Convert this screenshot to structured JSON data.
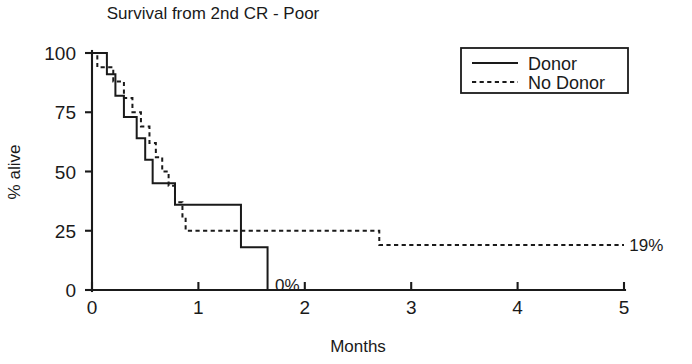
{
  "chart_data": {
    "type": "line",
    "title": "Survival from 2nd CR - Poor",
    "xlabel": "Months",
    "ylabel": "% alive",
    "xlim": [
      0,
      5
    ],
    "ylim": [
      0,
      100
    ],
    "xticks": [
      "0",
      "1",
      "2",
      "3",
      "4",
      "5"
    ],
    "xtick_values": [
      0,
      1,
      2,
      3,
      4,
      5
    ],
    "yticks": [
      "0",
      "25",
      "50",
      "75",
      "100"
    ],
    "ytick_values": [
      0,
      25,
      50,
      75,
      100
    ],
    "grid": false,
    "legend_position": "top-right",
    "series": [
      {
        "name": "Donor",
        "style": "solid",
        "points": [
          [
            0.0,
            100
          ],
          [
            0.14,
            100
          ],
          [
            0.14,
            91
          ],
          [
            0.22,
            91
          ],
          [
            0.22,
            82
          ],
          [
            0.3,
            82
          ],
          [
            0.3,
            73
          ],
          [
            0.42,
            73
          ],
          [
            0.42,
            64
          ],
          [
            0.5,
            64
          ],
          [
            0.5,
            55
          ],
          [
            0.57,
            55
          ],
          [
            0.57,
            45
          ],
          [
            0.78,
            45
          ],
          [
            0.78,
            36
          ],
          [
            1.4,
            36
          ],
          [
            1.4,
            18
          ],
          [
            1.65,
            18
          ],
          [
            1.65,
            0
          ],
          [
            1.8,
            0
          ]
        ]
      },
      {
        "name": "No Donor",
        "style": "dotted",
        "points": [
          [
            0.0,
            100
          ],
          [
            0.05,
            100
          ],
          [
            0.05,
            94
          ],
          [
            0.2,
            94
          ],
          [
            0.2,
            88
          ],
          [
            0.3,
            88
          ],
          [
            0.3,
            81
          ],
          [
            0.38,
            81
          ],
          [
            0.38,
            75
          ],
          [
            0.46,
            75
          ],
          [
            0.46,
            69
          ],
          [
            0.54,
            69
          ],
          [
            0.54,
            62
          ],
          [
            0.6,
            62
          ],
          [
            0.6,
            56
          ],
          [
            0.66,
            56
          ],
          [
            0.66,
            50
          ],
          [
            0.72,
            50
          ],
          [
            0.72,
            44
          ],
          [
            0.78,
            44
          ],
          [
            0.78,
            37
          ],
          [
            0.85,
            37
          ],
          [
            0.85,
            31
          ],
          [
            0.88,
            31
          ],
          [
            0.88,
            25
          ],
          [
            2.7,
            25
          ],
          [
            2.7,
            19
          ],
          [
            5.0,
            19
          ]
        ]
      }
    ],
    "annotations": [
      {
        "text": "0%",
        "x": 1.72,
        "y": 0,
        "series": "Donor"
      },
      {
        "text": "19%",
        "x": 5.05,
        "y": 19,
        "series": "No Donor"
      }
    ]
  },
  "legend": {
    "entries": [
      {
        "label": "Donor",
        "style": "solid"
      },
      {
        "label": "No Donor",
        "style": "dotted"
      }
    ]
  }
}
